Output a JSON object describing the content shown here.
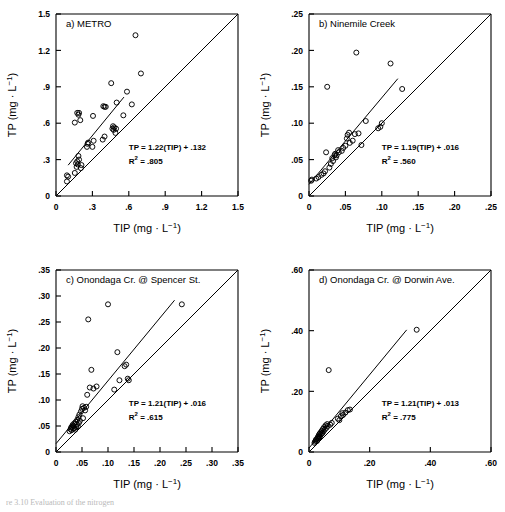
{
  "figure": {
    "caption_partial": "re 3.10  Evaluation of the nitrogen",
    "axis_labels": {
      "x": "TIP (mg · L−1)",
      "y": "TP (mg · L−1)"
    },
    "marker": "open-circle",
    "lines": [
      "regression-line",
      "one-to-one-line"
    ]
  },
  "chart_data": [
    {
      "type": "scatter",
      "panel": "a",
      "title": "a) METRO",
      "xlabel": "TIP (mg · L−1)",
      "ylabel": "TP (mg · L−1)",
      "xlim": [
        0,
        1.5
      ],
      "ylim": [
        0,
        1.5
      ],
      "xticks": [
        "0",
        ".3",
        ".6",
        ".9",
        "1.2",
        "1.5"
      ],
      "xtickvals": [
        0,
        0.3,
        0.6,
        0.9,
        1.2,
        1.5
      ],
      "yticks": [
        "0",
        ".3",
        ".6",
        ".9",
        "1.2",
        "1.5"
      ],
      "ytickvals": [
        0,
        0.3,
        0.6,
        0.9,
        1.2,
        1.5
      ],
      "grid": false,
      "equation": "TP = 1.22(TIP) + .132",
      "r2_label": "R2 = .805",
      "slope": 1.22,
      "intercept": 0.132,
      "r2": 0.805,
      "fit_x_range": [
        0.1,
        0.56
      ],
      "points": [
        [
          0.09,
          0.12
        ],
        [
          0.09,
          0.17
        ],
        [
          0.1,
          0.16
        ],
        [
          0.155,
          0.19
        ],
        [
          0.17,
          0.24
        ],
        [
          0.165,
          0.27
        ],
        [
          0.175,
          0.285
        ],
        [
          0.18,
          0.26
        ],
        [
          0.185,
          0.33
        ],
        [
          0.19,
          0.3
        ],
        [
          0.205,
          0.23
        ],
        [
          0.21,
          0.255
        ],
        [
          0.155,
          0.605
        ],
        [
          0.175,
          0.685
        ],
        [
          0.185,
          0.67
        ],
        [
          0.19,
          0.685
        ],
        [
          0.2,
          0.625
        ],
        [
          0.255,
          0.405
        ],
        [
          0.26,
          0.43
        ],
        [
          0.265,
          0.44
        ],
        [
          0.3,
          0.405
        ],
        [
          0.305,
          0.66
        ],
        [
          0.31,
          0.455
        ],
        [
          0.385,
          0.465
        ],
        [
          0.39,
          0.74
        ],
        [
          0.4,
          0.735
        ],
        [
          0.4,
          0.49
        ],
        [
          0.41,
          0.735
        ],
        [
          0.455,
          0.93
        ],
        [
          0.465,
          0.555
        ],
        [
          0.47,
          0.575
        ],
        [
          0.475,
          0.545
        ],
        [
          0.48,
          0.565
        ],
        [
          0.49,
          0.52
        ],
        [
          0.495,
          0.555
        ],
        [
          0.5,
          0.77
        ],
        [
          0.555,
          0.665
        ],
        [
          0.585,
          0.86
        ],
        [
          0.625,
          0.755
        ],
        [
          0.655,
          1.325
        ],
        [
          0.7,
          1.01
        ]
      ]
    },
    {
      "type": "scatter",
      "panel": "b",
      "title": "b) Ninemile Creek",
      "xlabel": "TIP (mg · L−1)",
      "ylabel": "TP (mg · L−1)",
      "xlim": [
        0,
        0.25
      ],
      "ylim": [
        0,
        0.25
      ],
      "xticks": [
        "0",
        ".05",
        ".10",
        ".15",
        ".20",
        ".25"
      ],
      "xtickvals": [
        0,
        0.05,
        0.1,
        0.15,
        0.2,
        0.25
      ],
      "yticks": [
        "0",
        ".05",
        ".10",
        ".15",
        ".20",
        ".25"
      ],
      "ytickvals": [
        0,
        0.05,
        0.1,
        0.15,
        0.2,
        0.25
      ],
      "grid": false,
      "equation": "TP = 1.19(TIP) + .016",
      "r2_label": "R2 = .560",
      "slope": 1.19,
      "intercept": 0.016,
      "r2": 0.56,
      "fit_x_range": [
        0.0,
        0.122
      ],
      "points": [
        [
          0.003,
          0.021
        ],
        [
          0.004,
          0.0225
        ],
        [
          0.01,
          0.024
        ],
        [
          0.013,
          0.026
        ],
        [
          0.017,
          0.029
        ],
        [
          0.02,
          0.031
        ],
        [
          0.022,
          0.034
        ],
        [
          0.0235,
          0.06
        ],
        [
          0.025,
          0.15
        ],
        [
          0.028,
          0.039
        ],
        [
          0.03,
          0.044
        ],
        [
          0.032,
          0.052
        ],
        [
          0.033,
          0.048
        ],
        [
          0.035,
          0.056
        ],
        [
          0.036,
          0.058
        ],
        [
          0.037,
          0.053
        ],
        [
          0.038,
          0.056
        ],
        [
          0.04,
          0.063
        ],
        [
          0.041,
          0.06
        ],
        [
          0.045,
          0.062
        ],
        [
          0.047,
          0.066
        ],
        [
          0.05,
          0.069
        ],
        [
          0.052,
          0.079
        ],
        [
          0.053,
          0.084
        ],
        [
          0.055,
          0.087
        ],
        [
          0.056,
          0.073
        ],
        [
          0.06,
          0.076
        ],
        [
          0.063,
          0.085
        ],
        [
          0.065,
          0.197
        ],
        [
          0.068,
          0.086
        ],
        [
          0.072,
          0.07
        ],
        [
          0.078,
          0.103
        ],
        [
          0.095,
          0.093
        ],
        [
          0.098,
          0.095
        ],
        [
          0.1,
          0.1
        ],
        [
          0.112,
          0.182
        ],
        [
          0.128,
          0.147
        ]
      ]
    },
    {
      "type": "scatter",
      "panel": "c",
      "title": "c) Onondaga Cr. @ Spencer St.",
      "xlabel": "TIP (mg · L−1)",
      "ylabel": "TP (mg · L−1)",
      "xlim": [
        0,
        0.35
      ],
      "ylim": [
        0,
        0.35
      ],
      "xticks": [
        "0",
        ".05",
        ".10",
        ".15",
        ".20",
        ".25",
        ".30",
        ".35"
      ],
      "xtickvals": [
        0,
        0.05,
        0.1,
        0.15,
        0.2,
        0.25,
        0.3,
        0.35
      ],
      "yticks": [
        "0",
        ".05",
        ".10",
        ".15",
        ".20",
        ".25",
        ".30",
        ".35"
      ],
      "ytickvals": [
        0,
        0.05,
        0.1,
        0.15,
        0.2,
        0.25,
        0.3,
        0.35
      ],
      "grid": false,
      "equation": "TP = 1.21(TIP) + .016",
      "r2_label": "R2 = .615",
      "slope": 1.21,
      "intercept": 0.016,
      "r2": 0.615,
      "fit_x_range": [
        0.0,
        0.228
      ],
      "points": [
        [
          0.026,
          0.04
        ],
        [
          0.028,
          0.044
        ],
        [
          0.029,
          0.047
        ],
        [
          0.03,
          0.042
        ],
        [
          0.031,
          0.049
        ],
        [
          0.032,
          0.052
        ],
        [
          0.033,
          0.045
        ],
        [
          0.034,
          0.05
        ],
        [
          0.035,
          0.055
        ],
        [
          0.036,
          0.046
        ],
        [
          0.037,
          0.043
        ],
        [
          0.038,
          0.058
        ],
        [
          0.039,
          0.048
        ],
        [
          0.04,
          0.053
        ],
        [
          0.041,
          0.062
        ],
        [
          0.042,
          0.049
        ],
        [
          0.043,
          0.067
        ],
        [
          0.044,
          0.056
        ],
        [
          0.045,
          0.072
        ],
        [
          0.046,
          0.06
        ],
        [
          0.048,
          0.078
        ],
        [
          0.05,
          0.083
        ],
        [
          0.051,
          0.088
        ],
        [
          0.052,
          0.065
        ],
        [
          0.054,
          0.085
        ],
        [
          0.056,
          0.08
        ],
        [
          0.058,
          0.087
        ],
        [
          0.06,
          0.11
        ],
        [
          0.062,
          0.255
        ],
        [
          0.065,
          0.124
        ],
        [
          0.068,
          0.158
        ],
        [
          0.072,
          0.122
        ],
        [
          0.078,
          0.126
        ],
        [
          0.1,
          0.284
        ],
        [
          0.112,
          0.12
        ],
        [
          0.118,
          0.192
        ],
        [
          0.122,
          0.138
        ],
        [
          0.132,
          0.165
        ],
        [
          0.135,
          0.168
        ],
        [
          0.138,
          0.141
        ],
        [
          0.14,
          0.138
        ],
        [
          0.242,
          0.284
        ]
      ]
    },
    {
      "type": "scatter",
      "panel": "d",
      "title": "d) Onondaga Cr. @ Dorwin Ave.",
      "xlabel": "TIP (mg · L−1)",
      "ylabel": "TP (mg · L−1)",
      "xlim": [
        0,
        0.6
      ],
      "ylim": [
        0,
        0.6
      ],
      "xticks": [
        "0",
        ".20",
        ".40",
        ".60"
      ],
      "xtickvals": [
        0,
        0.2,
        0.4,
        0.6
      ],
      "yticks": [
        "0",
        ".20",
        ".40",
        ".60"
      ],
      "ytickvals": [
        0,
        0.2,
        0.4,
        0.6
      ],
      "grid": false,
      "equation": "TP = 1.21(TIP) + .013",
      "r2_label": "R2 = .775",
      "slope": 1.21,
      "intercept": 0.013,
      "r2": 0.775,
      "fit_x_range": [
        0.0,
        0.322
      ],
      "points": [
        [
          0.018,
          0.03
        ],
        [
          0.02,
          0.034
        ],
        [
          0.022,
          0.038
        ],
        [
          0.024,
          0.042
        ],
        [
          0.026,
          0.036
        ],
        [
          0.028,
          0.046
        ],
        [
          0.03,
          0.05
        ],
        [
          0.031,
          0.044
        ],
        [
          0.032,
          0.055
        ],
        [
          0.034,
          0.048
        ],
        [
          0.035,
          0.06
        ],
        [
          0.036,
          0.052
        ],
        [
          0.038,
          0.064
        ],
        [
          0.04,
          0.058
        ],
        [
          0.042,
          0.07
        ],
        [
          0.044,
          0.062
        ],
        [
          0.046,
          0.076
        ],
        [
          0.048,
          0.068
        ],
        [
          0.05,
          0.082
        ],
        [
          0.052,
          0.074
        ],
        [
          0.055,
          0.088
        ],
        [
          0.058,
          0.08
        ],
        [
          0.06,
          0.092
        ],
        [
          0.062,
          0.086
        ],
        [
          0.065,
          0.27
        ],
        [
          0.07,
          0.09
        ],
        [
          0.075,
          0.096
        ],
        [
          0.095,
          0.11
        ],
        [
          0.1,
          0.105
        ],
        [
          0.105,
          0.118
        ],
        [
          0.11,
          0.128
        ],
        [
          0.112,
          0.122
        ],
        [
          0.12,
          0.13
        ],
        [
          0.128,
          0.138
        ],
        [
          0.135,
          0.14
        ],
        [
          0.355,
          0.403
        ]
      ]
    }
  ]
}
